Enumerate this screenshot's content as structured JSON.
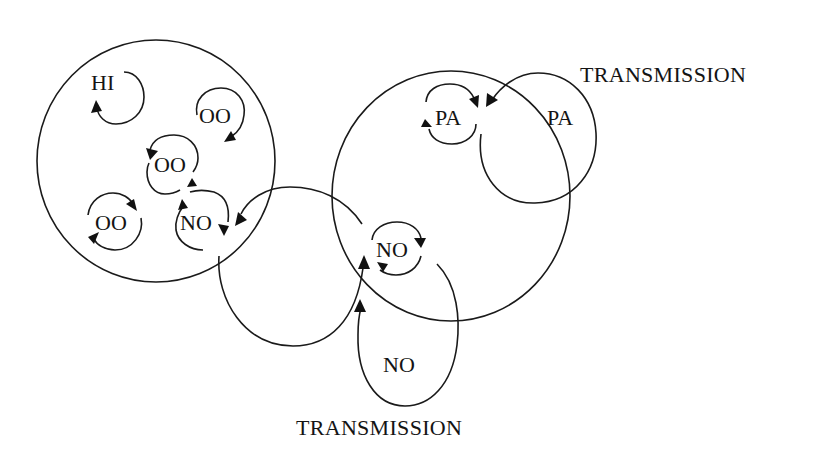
{
  "colors": {
    "ink": "#141414",
    "background": "#ffffff"
  },
  "labels": {
    "transmission_top": "TRANSMISSION",
    "transmission_bottom": "TRANSMISSION"
  },
  "left_cluster": {
    "nodes": [
      {
        "id": "hi",
        "label": "HI"
      },
      {
        "id": "oo_top_right",
        "label": "OO"
      },
      {
        "id": "oo_center",
        "label": "OO"
      },
      {
        "id": "oo_bottom_left",
        "label": "OO"
      },
      {
        "id": "no_left",
        "label": "NO"
      }
    ]
  },
  "right_cluster": {
    "nodes": [
      {
        "id": "pa_inner",
        "label": "PA"
      },
      {
        "id": "no_inner",
        "label": "NO"
      }
    ]
  },
  "external_nodes": [
    {
      "id": "pa_external",
      "label": "PA"
    },
    {
      "id": "no_external",
      "label": "NO"
    }
  ]
}
